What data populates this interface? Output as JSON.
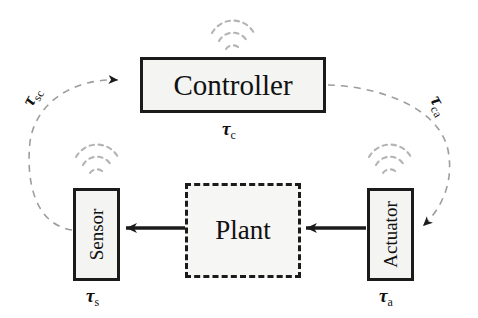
{
  "diagram": {
    "background_color": "#ffffff",
    "stroke_color": "#1b1b1b",
    "box_fill_color": "#f4f4f2",
    "dashed_link_color": "#9a9a9a",
    "nodes": [
      {
        "id": "controller",
        "label": "Controller",
        "shape": "rectangle",
        "border_style": "solid",
        "orientation": "horizontal",
        "delay_label_main": "τ",
        "delay_label_sub": "c"
      },
      {
        "id": "plant",
        "label": "Plant",
        "shape": "rectangle",
        "border_style": "dashed",
        "orientation": "horizontal",
        "delay_label_main": "",
        "delay_label_sub": ""
      },
      {
        "id": "sensor",
        "label": "Sensor",
        "shape": "rectangle",
        "border_style": "solid",
        "orientation": "vertical",
        "delay_label_main": "τ",
        "delay_label_sub": "s"
      },
      {
        "id": "actuator",
        "label": "Actuator",
        "shape": "rectangle",
        "border_style": "solid",
        "orientation": "vertical",
        "delay_label_main": "τ",
        "delay_label_sub": "a"
      }
    ],
    "links": [
      {
        "id": "sensor-to-controller",
        "from": "sensor",
        "to": "controller",
        "style": "dashed",
        "label_main": "τ",
        "label_sub": "sc"
      },
      {
        "id": "controller-to-actuator",
        "from": "controller",
        "to": "actuator",
        "style": "dashed",
        "label_main": "τ",
        "label_sub": "ca"
      },
      {
        "id": "plant-to-sensor",
        "from": "plant",
        "to": "sensor",
        "style": "solid",
        "label_main": "",
        "label_sub": ""
      },
      {
        "id": "actuator-to-plant",
        "from": "actuator",
        "to": "plant",
        "style": "solid",
        "label_main": "",
        "label_sub": ""
      }
    ],
    "wireless_icons": [
      {
        "id": "controller-wireless",
        "attached_to": "controller",
        "arcs": 3
      },
      {
        "id": "sensor-wireless",
        "attached_to": "sensor",
        "arcs": 3
      },
      {
        "id": "actuator-wireless",
        "attached_to": "actuator",
        "arcs": 3
      }
    ]
  }
}
